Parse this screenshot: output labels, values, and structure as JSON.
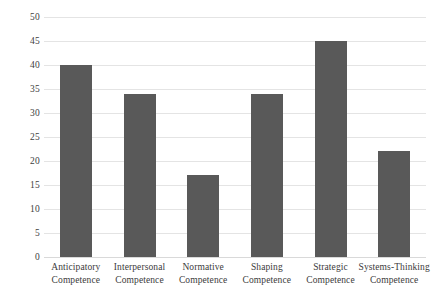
{
  "chart_data": {
    "type": "bar",
    "title": "",
    "subtitle": "",
    "xlabel": "",
    "ylabel": "",
    "categories": [
      "Anticipatory Competence",
      "Interpersonal Competence",
      "Normative Competence",
      "Shaping Competence",
      "Strategic Competence",
      "Systems-Thinking Competence"
    ],
    "category_lines": [
      [
        "Anticipatory",
        "Competence"
      ],
      [
        "Interpersonal",
        "Competence"
      ],
      [
        "Normative",
        "Competence"
      ],
      [
        "Shaping",
        "Competence"
      ],
      [
        "Strategic",
        "Competence"
      ],
      [
        "Systems-Thinking",
        "Competence"
      ]
    ],
    "values": [
      40,
      34,
      17,
      34,
      45,
      22
    ],
    "ylim": [
      0,
      50
    ],
    "ytick_step": 5,
    "yticks": [
      50,
      45,
      40,
      35,
      30,
      25,
      20,
      15,
      10,
      5,
      0
    ],
    "ytick_labels": [
      "50",
      "45",
      "40",
      "35",
      "30",
      "25",
      "20",
      "15",
      "10",
      "5",
      "0"
    ],
    "grid": true,
    "grid_axis": "y",
    "legend": false,
    "legend_position": "none",
    "bar_color": "#595959",
    "grid_color": "#e4e4e4",
    "axis_color": "#d9d9d9",
    "background_color": "#ffffff",
    "text_color": "#3b3b3b"
  }
}
